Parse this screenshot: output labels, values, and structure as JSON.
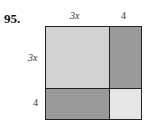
{
  "problem": {
    "number": "95."
  },
  "labels": {
    "top_left": "3x",
    "top_right": "4",
    "side_top": "3x",
    "side_bottom": "4"
  },
  "regions": [
    {
      "name": "3x-by-3x",
      "color": "#d2d2d2"
    },
    {
      "name": "4-by-3x-right",
      "color": "#9a9a9a"
    },
    {
      "name": "3x-by-4-bottom",
      "color": "#9a9a9a"
    },
    {
      "name": "4-by-4",
      "color": "#e6e6e6"
    }
  ]
}
